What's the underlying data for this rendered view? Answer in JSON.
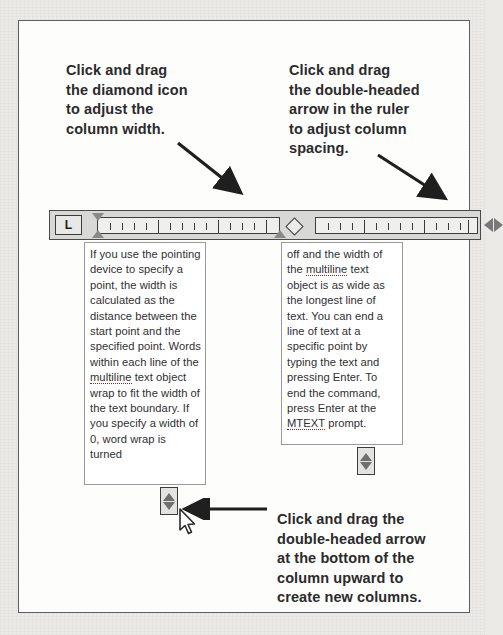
{
  "figure": {
    "callouts": {
      "left": "Click and drag\nthe diamond icon\nto adjust the\ncolumn width.",
      "right": "Click and drag\nthe double-headed\narrow in the ruler\nto adjust column\nspacing.",
      "bottom": "Click and drag the\ndouble-headed arrow\nat the bottom of the\ncolumn upward to\ncreate new columns."
    },
    "ruler": {
      "tab_selector_label": "L",
      "left_marker_name": "diamond-handle",
      "right_marker_name": "double-headed-arrow"
    },
    "columns": {
      "left": {
        "before_spell": "If you use the pointing device to specify a point, the width is calculated as the distance between the start point and the specified point. Words within each line of the ",
        "spell_word": "multiline",
        "after_spell": " text object wrap to fit the width of the text boundary. If you specify a width of 0, word wrap is turned"
      },
      "right": {
        "part1": "off and the width of the ",
        "spell_word_1": "multiline",
        "part2": " text object is as wide as the longest line of text. You can end a line of text at a specific point by typing the text and pressing Enter. To end the command, press Enter at the ",
        "spell_word_2": "MTEXT",
        "part3": " prompt."
      }
    },
    "handles": {
      "left_label": "column-height-handle",
      "right_label": "column-height-handle"
    },
    "colors": {
      "frame_border": "#5d5d5d",
      "ruler_fill": "#d8d8d6",
      "page_background": "#eceae6",
      "text": "#2b2b2b",
      "spell_underline": "#9a1f1f"
    }
  }
}
